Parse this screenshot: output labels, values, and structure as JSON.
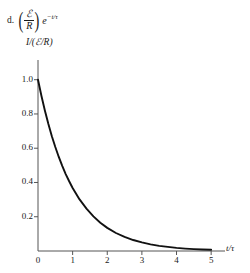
{
  "item": {
    "marker": "d.",
    "numerator": "ℰ",
    "denominator": "R",
    "exp_base": "e",
    "exp_superscript": "−t/τ",
    "full_text": "d. (ℰ/R)e^(−t/τ)"
  },
  "chart_data": {
    "type": "line",
    "title": "",
    "subtitle": "",
    "xlabel": "t/τ",
    "ylabel": "I/(ℰ/R)",
    "xlim": [
      0,
      5.4
    ],
    "ylim": [
      0,
      1.08
    ],
    "xticks": [
      "0",
      "1",
      "2",
      "3",
      "4",
      "5"
    ],
    "xtick_values": [
      0,
      1,
      2,
      3,
      4,
      5
    ],
    "yticks": [
      "0.2",
      "0.4",
      "0.6",
      "0.8",
      "1.0"
    ],
    "ytick_values": [
      0.2,
      0.4,
      0.6,
      0.8,
      1.0
    ],
    "grid": false,
    "legend": false,
    "curve_color": "#111111",
    "axis_color": "#555555",
    "series": [
      {
        "name": "I/(ℰ/R) = e^(−t/τ)",
        "x": [
          0.0,
          0.1,
          0.2,
          0.3,
          0.4,
          0.5,
          0.6,
          0.7,
          0.8,
          0.9,
          1.0,
          1.2,
          1.4,
          1.6,
          1.8,
          2.0,
          2.25,
          2.5,
          2.75,
          3.0,
          3.25,
          3.5,
          3.75,
          4.0,
          4.25,
          4.5,
          4.75,
          5.0
        ],
        "y": [
          1.0,
          0.905,
          0.819,
          0.741,
          0.67,
          0.607,
          0.549,
          0.497,
          0.449,
          0.407,
          0.368,
          0.301,
          0.247,
          0.202,
          0.165,
          0.135,
          0.105,
          0.082,
          0.064,
          0.05,
          0.039,
          0.03,
          0.024,
          0.018,
          0.014,
          0.011,
          0.009,
          0.007
        ]
      }
    ]
  }
}
